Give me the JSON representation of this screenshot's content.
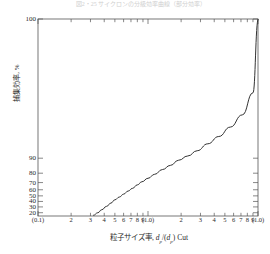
{
  "figure": {
    "clipped_caption": "図2・25 サイクロンの分級効率曲線（部分効率）",
    "background": "#ffffff",
    "line_color": "#333333",
    "axis_color": "#555555"
  },
  "chart_data": {
    "type": "line",
    "title": "",
    "xlabel": "粒子サイズ率, dp/(dp) Cut",
    "ylabel": "捕集効率, %",
    "xscale": "log",
    "yscale": "probability",
    "xlim": [
      0.1,
      10
    ],
    "ylim": [
      15,
      100
    ],
    "grid": false,
    "legend": null,
    "x_tick_labels": [
      "(0.1)",
      "2",
      "3",
      "4",
      "5",
      "6",
      "7",
      "8",
      "9",
      "(1.0)",
      "2",
      "3",
      "4",
      "5",
      "6",
      "7",
      "8",
      "9",
      "(1.0)"
    ],
    "x_tick_values": [
      0.1,
      0.2,
      0.3,
      0.4,
      0.5,
      0.6,
      0.7,
      0.8,
      0.9,
      1.0,
      2,
      3,
      4,
      5,
      6,
      7,
      8,
      9,
      10
    ],
    "x_major_labeled": [
      "(0.1)",
      "(1.0)",
      "(1.0)"
    ],
    "y_tick_labels": [
      "100",
      "90",
      "80",
      "70",
      "60",
      "50",
      "40",
      "30",
      "20"
    ],
    "y_tick_values": [
      100,
      90,
      80,
      70,
      60,
      50,
      40,
      30,
      20
    ],
    "series": [
      {
        "name": "分級効率曲線",
        "x": [
          0.32,
          0.35,
          0.38,
          0.42,
          0.46,
          0.5,
          0.55,
          0.6,
          0.66,
          0.72,
          0.8,
          0.88,
          1.0,
          1.15,
          1.35,
          1.6,
          1.9,
          2.3,
          2.8,
          3.5,
          4.4,
          5.6,
          7.2,
          9.0,
          10.0
        ],
        "y": [
          16,
          20,
          25,
          31,
          37,
          43,
          48,
          53,
          58,
          62,
          67,
          71,
          75,
          79,
          83,
          86,
          89,
          91,
          93,
          95,
          96.5,
          97.8,
          98.8,
          99.6,
          100
        ]
      }
    ]
  }
}
